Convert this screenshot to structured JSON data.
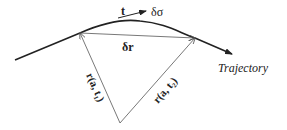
{
  "labels": {
    "tangent": "t",
    "arc_length": "δσ",
    "displacement": "δr",
    "trajectory": "Trajectory",
    "position_1": "r(a, t₁)",
    "position_2": "r(a, t₂)"
  },
  "colors": {
    "stroke": "#222222",
    "thin": "#555555",
    "background": "#ffffff"
  }
}
